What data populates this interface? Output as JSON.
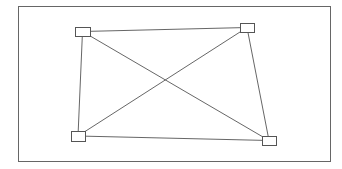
{
  "diagram": {
    "type": "complete-graph-k4",
    "frame": {
      "x": 18,
      "y": 6,
      "width": 312,
      "height": 155,
      "stroke": "#666666"
    },
    "nodes": [
      {
        "id": "top-left",
        "x": 75,
        "y": 27,
        "width": 15,
        "height": 9
      },
      {
        "id": "top-right",
        "x": 240,
        "y": 23,
        "width": 14,
        "height": 9
      },
      {
        "id": "bottom-left",
        "x": 71,
        "y": 131,
        "width": 14,
        "height": 10
      },
      {
        "id": "bottom-right",
        "x": 262,
        "y": 136,
        "width": 14,
        "height": 9
      }
    ],
    "edges": [
      {
        "from": "top-left",
        "to": "top-right"
      },
      {
        "from": "top-left",
        "to": "bottom-left"
      },
      {
        "from": "top-left",
        "to": "bottom-right"
      },
      {
        "from": "top-right",
        "to": "bottom-left"
      },
      {
        "from": "top-right",
        "to": "bottom-right"
      },
      {
        "from": "bottom-left",
        "to": "bottom-right"
      }
    ],
    "colors": {
      "edge": "#555555",
      "node_stroke": "#555555",
      "node_fill": "#ffffff",
      "background": "#ffffff"
    }
  }
}
